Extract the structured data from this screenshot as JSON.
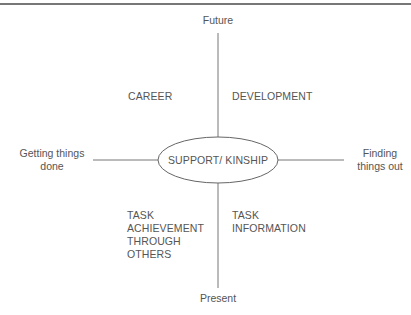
{
  "diagram": {
    "axes": {
      "top": "Future",
      "bottom": "Present",
      "left_line1": "Getting things",
      "left_line2": "done",
      "right_line1": "Finding",
      "right_line2": "things out"
    },
    "center": "SUPPORT/ KINSHIP",
    "quadrants": {
      "top_left": "CAREER",
      "top_right": "DEVELOPMENT",
      "bottom_left": [
        "TASK",
        "ACHIEVEMENT",
        "THROUGH",
        "OTHERS"
      ],
      "bottom_right": [
        "TASK",
        "INFORMATION"
      ]
    },
    "colors": {
      "line": "#777777",
      "text": "#555555"
    }
  }
}
